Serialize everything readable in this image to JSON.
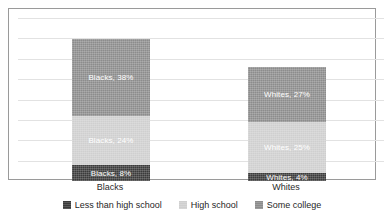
{
  "chart_data": {
    "type": "bar",
    "subtype": "stacked-bar",
    "title": "",
    "xlabel": "",
    "ylabel": "",
    "categories": [
      "Blacks",
      "Whites"
    ],
    "series": [
      {
        "name": "Less than high school",
        "color": "#3b3b3b",
        "values": [
          8,
          4
        ],
        "point_labels": [
          "Blacks, 8%",
          "Whites, 4%"
        ]
      },
      {
        "name": "High school",
        "color": "#cfcfcf",
        "values": [
          24,
          25
        ],
        "point_labels": [
          "Blacks, 24%",
          "Whites, 25%"
        ]
      },
      {
        "name": "Some college",
        "color": "#8c8c8c",
        "values": [
          38,
          27
        ],
        "point_labels": [
          "Blacks, 38%",
          "Whites, 27%"
        ]
      }
    ],
    "totals": [
      70,
      56
    ],
    "ylim": [
      0,
      80
    ],
    "gridlines": 8,
    "grid": true,
    "axis_tick_labels_visible": false,
    "legend_position": "bottom"
  },
  "legend": {
    "items": [
      {
        "label": "Less than high school",
        "color": "#3b3b3b"
      },
      {
        "label": "High school",
        "color": "#cfcfcf"
      },
      {
        "label": "Some college",
        "color": "#8c8c8c"
      }
    ]
  },
  "axis": {
    "categories": [
      {
        "label": "Blacks"
      },
      {
        "label": "Whites"
      }
    ]
  },
  "colors": {
    "frame_border": "#9a9a9a",
    "gridline": "#e2e2e2",
    "plot_background": "#ffffff",
    "label_text": "#ffffff",
    "axis_text": "#2b2b2b"
  }
}
